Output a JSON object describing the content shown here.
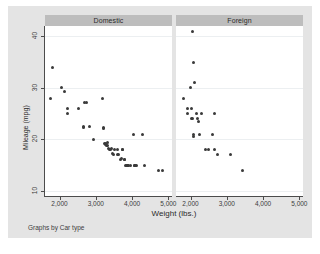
{
  "chart_data": {
    "type": "scatter",
    "title": "",
    "xlabel": "Weight (lbs.)",
    "ylabel": "Mileage (mpg)",
    "note": "Graphs by Car type",
    "xlim": [
      1600,
      5100
    ],
    "ylim": [
      9,
      42
    ],
    "xticks": [
      2000,
      3000,
      4000,
      5000
    ],
    "xtick_labels": [
      "2,000",
      "3,000",
      "4,000",
      "5,000"
    ],
    "yticks": [
      10,
      20,
      30,
      40
    ],
    "ytick_labels": [
      "10",
      "20",
      "30",
      "40"
    ],
    "grid": "horizontal",
    "legend": "none",
    "facet_by": "Car type",
    "marker_color": "#3a3a3a",
    "panel_header_color": "#bdbdbd",
    "background_color": "#e4e4e4",
    "plot_background_color": "#ffffff",
    "panels": [
      {
        "label": "Domestic",
        "x": [
          1800,
          1760,
          2050,
          2130,
          2230,
          2230,
          2520,
          2650,
          2670,
          2690,
          2750,
          2830,
          2930,
          3180,
          3200,
          3210,
          3250,
          3260,
          3280,
          3300,
          3310,
          3330,
          3350,
          3370,
          3400,
          3420,
          3470,
          3490,
          3510,
          3600,
          3600,
          3620,
          3690,
          3700,
          3730,
          3740,
          3780,
          3800,
          3830,
          3850,
          3870,
          3880,
          3900,
          3960,
          4030,
          4060,
          4080,
          4100,
          4130,
          4290,
          4330,
          4720,
          4840
        ],
        "y": [
          34,
          28,
          30,
          29.2,
          26,
          25,
          26,
          22.5,
          22.3,
          27.2,
          27.1,
          22.4,
          20,
          28,
          22.3,
          22.2,
          19.2,
          19.1,
          19,
          18.9,
          18.8,
          19.3,
          18.2,
          18.1,
          18,
          18.2,
          17.2,
          17.1,
          18.1,
          17.1,
          18,
          17,
          16.1,
          16.2,
          18,
          18,
          16.1,
          16,
          15,
          15,
          15,
          15,
          14.9,
          15,
          21,
          15,
          15,
          14.9,
          15,
          21,
          15,
          14,
          14
        ],
        "description": "Domestic cars: mileage declines with weight"
      },
      {
        "label": "Foreign",
        "x": [
          2050,
          2070,
          1990,
          2120,
          1800,
          1930,
          1920,
          2040,
          2160,
          2020,
          2060,
          2200,
          2230,
          2290,
          2070,
          2240,
          2070,
          2650,
          2600,
          2410,
          2500,
          2670,
          2750,
          3100,
          3420
        ],
        "y": [
          41,
          35,
          30,
          31,
          28,
          26,
          25,
          26,
          25,
          24,
          24,
          24,
          23.5,
          25,
          21,
          21,
          20.5,
          25,
          21,
          18,
          18,
          18,
          17,
          17,
          14
        ],
        "description": "Foreign cars: mostly lighter, higher mileage"
      }
    ]
  },
  "axis": {
    "y_title": "Mileage (mpg)",
    "x_title": "Weight (lbs.)"
  },
  "note": {
    "text": "Graphs by Car type"
  }
}
